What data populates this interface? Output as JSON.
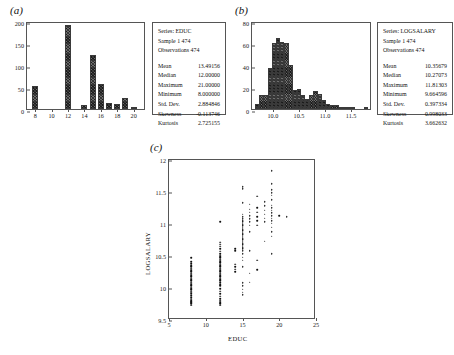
{
  "figure": {
    "panels": [
      {
        "id": "a",
        "label": "(a)"
      },
      {
        "id": "b",
        "label": "(b)"
      },
      {
        "id": "c",
        "label": "(c)"
      }
    ]
  },
  "panel_a": {
    "label": "(a)",
    "stats": {
      "series_label": "Series: EDUC",
      "sample_label": "Sample 1 474",
      "observations_label": "Observations 474",
      "rows": [
        {
          "name": "Mean",
          "value": "13.49156"
        },
        {
          "name": "Median",
          "value": "12.00000"
        },
        {
          "name": "Maximum",
          "value": "21.00000"
        },
        {
          "name": "Minimum",
          "value": "8.000000"
        },
        {
          "name": "Std. Dev.",
          "value": "2.884846"
        },
        {
          "name": "Skewness",
          "value": "-0.113746"
        },
        {
          "name": "Kurtosis",
          "value": "2.725155"
        }
      ]
    }
  },
  "panel_b": {
    "label": "(b)",
    "stats": {
      "series_label": "Series: LOGSALARY",
      "sample_label": "Sample 1 474",
      "observations_label": "Observations 474",
      "rows": [
        {
          "name": "Mean",
          "value": "10.35679"
        },
        {
          "name": "Median",
          "value": "10.27073"
        },
        {
          "name": "Maximum",
          "value": "11.81303"
        },
        {
          "name": "Minimum",
          "value": "9.664596"
        },
        {
          "name": "Std. Dev.",
          "value": "0.397334"
        },
        {
          "name": "Skewness",
          "value": "0.998033"
        },
        {
          "name": "Kurtosis",
          "value": "3.662632"
        }
      ]
    }
  },
  "panel_c": {
    "label": "(c)",
    "xlabel": "EDUC",
    "ylabel": "LOGSALARY"
  },
  "chart_data": [
    {
      "id": "panel_a",
      "type": "bar",
      "title": "(a)",
      "subtitle": "Histogram of EDUC",
      "xlabel": "",
      "ylabel": "",
      "xlim": [
        7,
        21.5
      ],
      "ylim": [
        0,
        200
      ],
      "xticks": [
        8,
        10,
        12,
        14,
        16,
        18,
        20
      ],
      "yticks": [
        0,
        50,
        100,
        150,
        200
      ],
      "grid": false,
      "categories": [
        8,
        12,
        14,
        15,
        16,
        17,
        18,
        19,
        20
      ],
      "values": [
        53,
        190,
        8,
        122,
        57,
        13,
        12,
        26,
        3
      ],
      "bar_color": "#6e6e6e"
    },
    {
      "id": "panel_b",
      "type": "bar",
      "title": "(b)",
      "subtitle": "Histogram of LOGSALARY",
      "xlabel": "",
      "ylabel": "",
      "xlim": [
        9.6,
        11.9
      ],
      "ylim": [
        0,
        80
      ],
      "xticks": [
        10.0,
        10.5,
        11.0,
        11.5
      ],
      "yticks": [
        0,
        20,
        40,
        60,
        80
      ],
      "grid": false,
      "categories": [
        9.7,
        9.78,
        9.86,
        9.94,
        10.02,
        10.1,
        10.18,
        10.26,
        10.34,
        10.42,
        10.5,
        10.58,
        10.66,
        10.74,
        10.82,
        10.9,
        10.98,
        11.06,
        11.14,
        11.22,
        11.3,
        11.38,
        11.46,
        11.54,
        11.62,
        11.7,
        11.78
      ],
      "values": [
        5,
        13,
        13,
        37,
        60,
        65,
        61,
        60,
        40,
        17,
        18,
        13,
        9,
        13,
        16,
        14,
        8,
        5,
        4,
        4,
        2,
        1,
        1,
        1,
        0,
        0,
        1
      ],
      "bar_color": "#6e6e6e"
    },
    {
      "id": "panel_c",
      "type": "scatter",
      "title": "(c)",
      "xlabel": "EDUC",
      "ylabel": "LOGSALARY",
      "xlim": [
        5,
        25
      ],
      "ylim": [
        9.5,
        12.0
      ],
      "xticks": [
        5,
        10,
        15,
        20,
        25
      ],
      "yticks": [
        9.5,
        10.0,
        10.5,
        11.0,
        11.5,
        12.0
      ],
      "grid": false,
      "marker_color": "#111111",
      "points": [
        [
          8,
          9.7
        ],
        [
          8,
          9.72
        ],
        [
          8,
          9.74
        ],
        [
          8,
          9.75
        ],
        [
          8,
          9.77
        ],
        [
          8,
          9.79
        ],
        [
          8,
          9.82
        ],
        [
          8,
          9.85
        ],
        [
          8,
          9.88
        ],
        [
          8,
          9.9
        ],
        [
          8,
          9.92
        ],
        [
          8,
          9.94
        ],
        [
          8,
          9.96
        ],
        [
          8,
          9.98
        ],
        [
          8,
          10.0
        ],
        [
          8,
          10.02
        ],
        [
          8,
          10.04
        ],
        [
          8,
          10.06
        ],
        [
          8,
          10.08
        ],
        [
          8,
          10.1
        ],
        [
          8,
          10.12
        ],
        [
          8,
          10.14
        ],
        [
          8,
          10.16
        ],
        [
          8,
          10.18
        ],
        [
          8,
          10.2
        ],
        [
          8,
          10.22
        ],
        [
          8,
          10.24
        ],
        [
          8,
          10.26
        ],
        [
          8,
          10.28
        ],
        [
          8,
          10.3
        ],
        [
          8,
          10.32
        ],
        [
          8,
          10.35
        ],
        [
          8,
          10.38
        ],
        [
          8,
          10.44
        ],
        [
          12,
          9.7
        ],
        [
          12,
          9.72
        ],
        [
          12,
          9.74
        ],
        [
          12,
          9.76
        ],
        [
          12,
          9.78
        ],
        [
          12,
          9.8
        ],
        [
          12,
          9.84
        ],
        [
          12,
          9.88
        ],
        [
          12,
          9.92
        ],
        [
          12,
          9.96
        ],
        [
          12,
          10.0
        ],
        [
          12,
          10.02
        ],
        [
          12,
          10.05
        ],
        [
          12,
          10.08
        ],
        [
          12,
          10.1
        ],
        [
          12,
          10.12
        ],
        [
          12,
          10.14
        ],
        [
          12,
          10.16
        ],
        [
          12,
          10.18
        ],
        [
          12,
          10.2
        ],
        [
          12,
          10.22
        ],
        [
          12,
          10.24
        ],
        [
          12,
          10.26
        ],
        [
          12,
          10.28
        ],
        [
          12,
          10.3
        ],
        [
          12,
          10.32
        ],
        [
          12,
          10.34
        ],
        [
          12,
          10.36
        ],
        [
          12,
          10.38
        ],
        [
          12,
          10.4
        ],
        [
          12,
          10.42
        ],
        [
          12,
          10.44
        ],
        [
          12,
          10.46
        ],
        [
          12,
          10.48
        ],
        [
          12,
          10.5
        ],
        [
          12,
          10.54
        ],
        [
          12,
          10.58
        ],
        [
          12,
          10.62
        ],
        [
          12,
          10.65
        ],
        [
          12,
          10.68
        ],
        [
          12,
          11.0
        ],
        [
          14,
          10.22
        ],
        [
          14,
          10.26
        ],
        [
          14,
          10.3
        ],
        [
          14,
          10.34
        ],
        [
          14,
          10.55
        ],
        [
          14,
          10.58
        ],
        [
          15,
          9.86
        ],
        [
          15,
          9.9
        ],
        [
          15,
          9.95
        ],
        [
          15,
          10.0
        ],
        [
          15,
          10.05
        ],
        [
          15,
          10.3
        ],
        [
          15,
          10.4
        ],
        [
          15,
          10.45
        ],
        [
          15,
          10.5
        ],
        [
          15,
          10.55
        ],
        [
          15,
          10.58
        ],
        [
          15,
          10.6
        ],
        [
          15,
          10.62
        ],
        [
          15,
          10.64
        ],
        [
          15,
          10.66
        ],
        [
          15,
          10.68
        ],
        [
          15,
          10.7
        ],
        [
          15,
          10.72
        ],
        [
          15,
          10.74
        ],
        [
          15,
          10.76
        ],
        [
          15,
          10.78
        ],
        [
          15,
          10.8
        ],
        [
          15,
          10.82
        ],
        [
          15,
          10.84
        ],
        [
          15,
          10.86
        ],
        [
          15,
          10.88
        ],
        [
          15,
          10.9
        ],
        [
          15,
          10.92
        ],
        [
          15,
          10.94
        ],
        [
          15,
          10.96
        ],
        [
          15,
          10.98
        ],
        [
          15,
          11.0
        ],
        [
          15,
          11.02
        ],
        [
          15,
          11.05
        ],
        [
          15,
          11.08
        ],
        [
          15,
          11.12
        ],
        [
          15,
          11.3
        ],
        [
          15,
          11.52
        ],
        [
          15,
          11.55
        ],
        [
          16,
          10.06
        ],
        [
          16,
          10.2
        ],
        [
          16,
          10.55
        ],
        [
          16,
          10.85
        ],
        [
          16,
          10.95
        ],
        [
          16,
          11.0
        ],
        [
          16,
          11.05
        ],
        [
          16,
          11.1
        ],
        [
          16,
          11.15
        ],
        [
          16,
          11.2
        ],
        [
          16,
          11.28
        ],
        [
          17,
          10.25
        ],
        [
          17,
          10.4
        ],
        [
          17,
          10.95
        ],
        [
          17,
          11.02
        ],
        [
          17,
          11.08
        ],
        [
          17,
          11.15
        ],
        [
          17,
          11.22
        ],
        [
          17,
          11.4
        ],
        [
          18,
          10.7
        ],
        [
          18,
          11.0
        ],
        [
          18,
          11.06
        ],
        [
          18,
          11.12
        ],
        [
          18,
          11.18
        ],
        [
          18,
          11.25
        ],
        [
          18,
          11.32
        ],
        [
          19,
          10.5
        ],
        [
          19,
          10.78
        ],
        [
          19,
          10.85
        ],
        [
          19,
          10.92
        ],
        [
          19,
          10.98
        ],
        [
          19,
          11.02
        ],
        [
          19,
          11.06
        ],
        [
          19,
          11.1
        ],
        [
          19,
          11.14
        ],
        [
          19,
          11.18
        ],
        [
          19,
          11.22
        ],
        [
          19,
          11.26
        ],
        [
          19,
          11.35
        ],
        [
          19,
          11.42
        ],
        [
          19,
          11.46
        ],
        [
          19,
          11.5
        ],
        [
          19,
          11.6
        ],
        [
          19,
          11.8
        ],
        [
          20,
          11.1
        ],
        [
          21,
          11.08
        ]
      ]
    }
  ]
}
